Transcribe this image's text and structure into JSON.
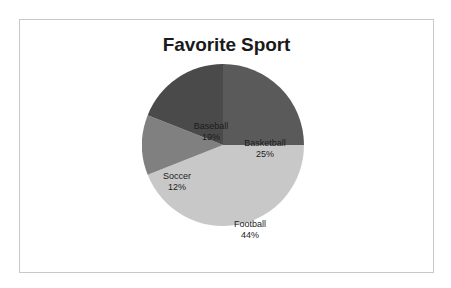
{
  "chart_data": {
    "type": "pie",
    "title": "Favorite Sport",
    "xlabel": "",
    "ylabel": "",
    "legend": "none",
    "grid": false,
    "start_angle_deg": 0,
    "direction": "clockwise",
    "categories": [
      "Basketball",
      "Football",
      "Soccer",
      "Baseball"
    ],
    "values": [
      25,
      44,
      12,
      19
    ],
    "value_unit": "percent",
    "labels": [
      {
        "name": "Basketball",
        "percent": 25,
        "percent_text": "25%",
        "color": "#5a5a5a"
      },
      {
        "name": "Football",
        "percent": 44,
        "percent_text": "44%",
        "color": "#c8c8c8"
      },
      {
        "name": "Soccer",
        "percent": 12,
        "percent_text": "12%",
        "color": "#808080"
      },
      {
        "name": "Baseball",
        "percent": 19,
        "percent_text": "19%",
        "color": "#4a4a4a"
      }
    ]
  },
  "chart": {
    "title": "Favorite Sport",
    "frame_border_color": "#c9c9c9",
    "background": "#ffffff",
    "slices": [
      {
        "name": "Basketball",
        "percent_text": "25%"
      },
      {
        "name": "Football",
        "percent_text": "44%"
      },
      {
        "name": "Soccer",
        "percent_text": "12%"
      },
      {
        "name": "Baseball",
        "percent_text": "19%"
      }
    ]
  }
}
